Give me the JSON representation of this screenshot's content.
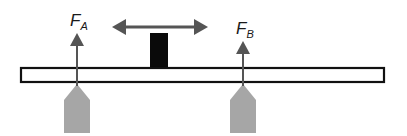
{
  "diagram": {
    "type": "beam-on-two-supports",
    "labels": {
      "force_a_main": "F",
      "force_a_sub": "A",
      "force_b_main": "F",
      "force_b_sub": "B"
    },
    "colors": {
      "beam_stroke": "#111111",
      "beam_fill": "#ffffff",
      "support_fill": "#a6a6a6",
      "arrow": "#555555",
      "mass": "#0a0a0a"
    },
    "elements": [
      "beam",
      "support-a",
      "support-b",
      "force-arrow-a",
      "force-arrow-b",
      "movable-mass",
      "double-headed-motion-arrow"
    ]
  }
}
